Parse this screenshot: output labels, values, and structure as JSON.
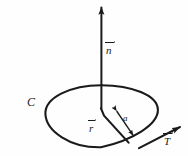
{
  "figure": {
    "kind": "vector-calculus-diagram",
    "width": 188,
    "height": 156,
    "background_color": "#fefefe",
    "ink_color": "#1a1a1a",
    "labels": {
      "normal_vector": "n",
      "curve": "C",
      "position_vector": "r",
      "radius": "a",
      "tangent_vector": "T"
    },
    "elements": {
      "normal_arrow_name": "normal-vector-arrow",
      "curve_name": "closed-curve-ellipse",
      "radius_arrow_name": "radius-dimension-arrow",
      "position_arrow_name": "position-vector-arrow",
      "tangent_arrow_name": "tangent-vector-arrow"
    }
  }
}
